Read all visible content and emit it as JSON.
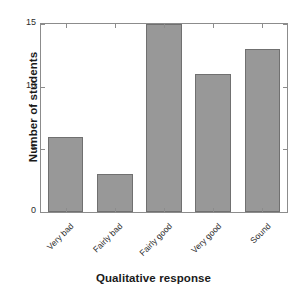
{
  "chart_data": {
    "type": "bar",
    "title": "",
    "xlabel": "Qualitative response",
    "ylabel": "Number of students",
    "categories": [
      "Very bad",
      "Fairly bad",
      "Fairly good",
      "Very good",
      "Sound"
    ],
    "values": [
      6,
      3,
      15,
      11,
      13
    ],
    "ylim": [
      0,
      15
    ],
    "yticks": [
      0,
      5,
      10,
      15
    ],
    "ytick_labels": [
      "0",
      "5",
      "10",
      "15"
    ],
    "grid": false,
    "legend": false,
    "bar_color": "#989898",
    "bar_edge_color": "#707070",
    "axis_color": "#8c8c8c",
    "text_color": "#1a1a1a",
    "background": "#ffffff",
    "xtick_label_rotation": -45
  }
}
